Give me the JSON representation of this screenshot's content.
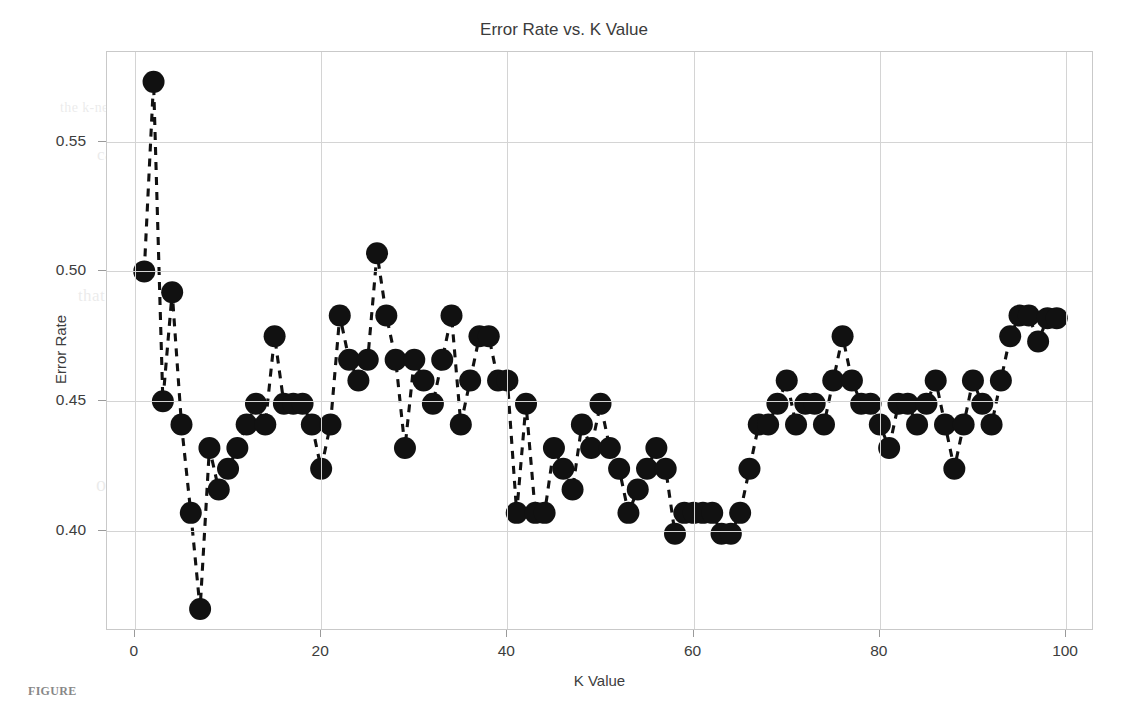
{
  "figure": {
    "caption_fragment": "FIGURE",
    "background_color": "#ffffff",
    "ink_color": "#111111",
    "grid_color": "#d4d4d4",
    "axis_color": "#c9c9c9"
  },
  "ghost_text": {
    "lines": [
      "the k-nearest neighbors algorithm was evaluated across a range of",
      "candidate values in order to determine the optimal parameter",
      "setting for this particular classification problem domain",
      "selecting an appropriate value of k is critical because a value",
      "that is too small produces a model that is highly sensitive to",
      "noise while a value that is too large oversmooths the decision",
      "boundary and may include points from other classes entirely",
      "the error rate is computed as the fraction of misclassified",
      "observations in the held out test partition of the dataset",
      "a plot of error rate against k reveals the characteristic elbow"
    ]
  },
  "chart_data": {
    "type": "line",
    "title": "Error Rate vs. K Value",
    "xlabel": "K Value",
    "ylabel": "Error Rate",
    "xlim": [
      -3,
      103
    ],
    "ylim": [
      0.3615,
      0.5845
    ],
    "xticks": [
      0,
      20,
      40,
      60,
      80,
      100
    ],
    "xtick_labels": [
      "0",
      "20",
      "40",
      "60",
      "80",
      "100"
    ],
    "yticks": [
      0.4,
      0.45,
      0.5,
      0.55
    ],
    "ytick_labels": [
      "0.40",
      "0.45",
      "0.50",
      "0.55"
    ],
    "grid": true,
    "legend": null,
    "marker": "circle",
    "marker_size": 11,
    "linestyle": "dashed",
    "color": "#111111",
    "x": [
      1,
      2,
      3,
      4,
      5,
      6,
      7,
      8,
      9,
      10,
      11,
      12,
      13,
      14,
      15,
      16,
      17,
      18,
      19,
      20,
      21,
      22,
      23,
      24,
      25,
      26,
      27,
      28,
      29,
      30,
      31,
      32,
      33,
      34,
      35,
      36,
      37,
      38,
      39,
      40,
      41,
      42,
      43,
      44,
      45,
      46,
      47,
      48,
      49,
      50,
      51,
      52,
      53,
      54,
      55,
      56,
      57,
      58,
      59,
      60,
      61,
      62,
      63,
      64,
      65,
      66,
      67,
      68,
      69,
      70,
      71,
      72,
      73,
      74,
      75,
      76,
      77,
      78,
      79,
      80,
      81,
      82,
      83,
      84,
      85,
      86,
      87,
      88,
      89,
      90,
      91,
      92,
      93,
      94,
      95,
      96,
      97,
      98,
      99
    ],
    "y": [
      0.5,
      0.573,
      0.45,
      0.492,
      0.441,
      0.407,
      0.37,
      0.432,
      0.416,
      0.424,
      0.432,
      0.441,
      0.449,
      0.441,
      0.475,
      0.449,
      0.449,
      0.449,
      0.441,
      0.424,
      0.441,
      0.483,
      0.466,
      0.458,
      0.466,
      0.507,
      0.483,
      0.466,
      0.432,
      0.466,
      0.458,
      0.449,
      0.466,
      0.483,
      0.441,
      0.458,
      0.475,
      0.475,
      0.458,
      0.458,
      0.407,
      0.449,
      0.407,
      0.407,
      0.432,
      0.424,
      0.416,
      0.441,
      0.432,
      0.449,
      0.432,
      0.424,
      0.407,
      0.416,
      0.424,
      0.432,
      0.424,
      0.399,
      0.407,
      0.407,
      0.407,
      0.407,
      0.399,
      0.399,
      0.407,
      0.424,
      0.441,
      0.441,
      0.449,
      0.458,
      0.441,
      0.449,
      0.449,
      0.441,
      0.458,
      0.475,
      0.458,
      0.449,
      0.449,
      0.441,
      0.432,
      0.449,
      0.449,
      0.441,
      0.449,
      0.458,
      0.441,
      0.424,
      0.441,
      0.458,
      0.449,
      0.441,
      0.458,
      0.475,
      0.483,
      0.483,
      0.473,
      0.482,
      0.482
    ]
  }
}
